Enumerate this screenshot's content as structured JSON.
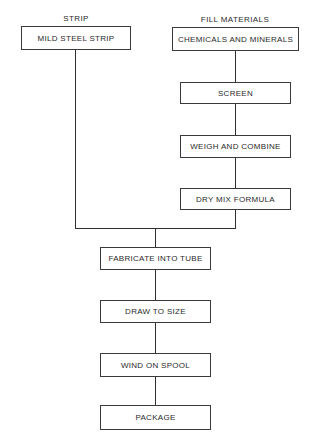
{
  "diagram": {
    "type": "flowchart",
    "columns": {
      "left": {
        "heading": "STRIP",
        "steps": [
          "MILD STEEL STRIP"
        ]
      },
      "right": {
        "heading": "FILL MATERIALS",
        "steps": [
          "CHEMICALS AND MINERALS",
          "SCREEN",
          "WEIGH AND COMBINE",
          "DRY MIX FORMULA"
        ]
      }
    },
    "merged_steps": [
      "FABRICATE INTO TUBE",
      "DRAW TO SIZE",
      "WIND ON SPOOL",
      "PACKAGE"
    ],
    "line_color": "#2f2f2f",
    "box_border_color": "#3a3a3a"
  }
}
